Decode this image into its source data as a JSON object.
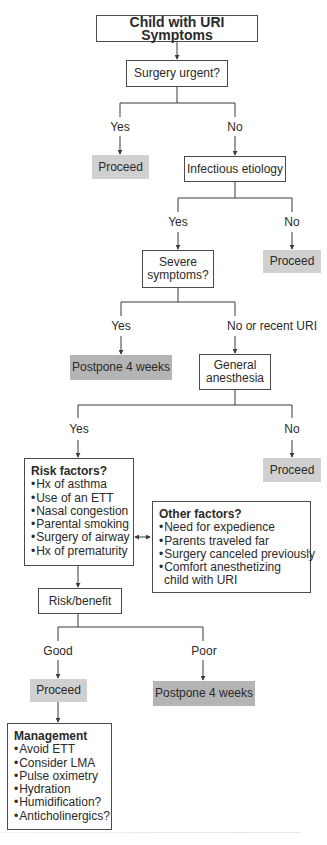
{
  "diagram": {
    "title": "Child with URI Symptoms",
    "nodes": {
      "surgery_urgent": "Surgery urgent?",
      "proceed_1": "Proceed",
      "infectious_etiology": "Infectious etiology",
      "severe_symptoms": [
        "Severe",
        "symptoms?"
      ],
      "proceed_2": "Proceed",
      "postpone_1": "Postpone 4 weeks",
      "general_anesthesia": [
        "General",
        "anesthesia"
      ],
      "proceed_3": "Proceed",
      "risk_benefit": "Risk/benefit",
      "proceed_4": "Proceed",
      "postpone_2": "Postpone 4 weeks"
    },
    "edge_labels": {
      "urgent_yes": "Yes",
      "urgent_no": "No",
      "infectious_yes": "Yes",
      "infectious_no": "No",
      "severe_yes": "Yes",
      "severe_no": "No or recent URI",
      "ga_yes": "Yes",
      "ga_no": "No",
      "rb_good": "Good",
      "rb_poor": "Poor"
    },
    "risk_factors": {
      "heading": "Risk factors?",
      "items": [
        "Hx of asthma",
        "Use of an ETT",
        "Nasal congestion",
        "Parental smoking",
        "Surgery of airway",
        "Hx of prematurity"
      ]
    },
    "other_factors": {
      "heading": "Other factors?",
      "items": [
        "Need for expedience",
        "Parents traveled far",
        "Surgery canceled previously",
        "Comfort anesthetizing"
      ],
      "continuation": "child with URI"
    },
    "management": {
      "heading": "Management",
      "items": [
        "Avoid ETT",
        "Consider LMA",
        "Pulse oximetry",
        "Hydration",
        "Humidification?",
        "Anticholinergics?"
      ]
    },
    "bullet": "•",
    "colors": {
      "line": "#3a3a3a",
      "proceed_fill": "#d0d0d0",
      "postpone_fill": "#b4b4b4"
    }
  }
}
